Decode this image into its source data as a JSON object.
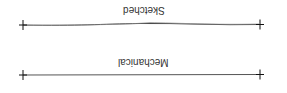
{
  "diagram": {
    "rows": [
      {
        "label": "Sketched",
        "style": "sketched",
        "y": 25,
        "x_start": 23,
        "x_end": 260
      },
      {
        "label": "Mechanical",
        "style": "mechanical",
        "y": 75,
        "x_start": 23,
        "x_end": 260
      }
    ],
    "orientation": "rotated-180",
    "colors": {
      "line": "#555555",
      "marker": "#111111",
      "text": "#333333",
      "background": "#ffffff"
    }
  }
}
